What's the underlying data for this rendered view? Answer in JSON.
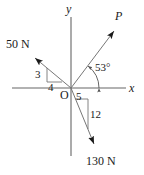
{
  "figure": {
    "background_color": "#ffffff",
    "stroke_color": "#555555",
    "text_color": "#1a1a1a"
  },
  "axes": {
    "origin_label": "O",
    "x_label": "x",
    "y_label": "y"
  },
  "vectors": [
    {
      "name": "force-50n",
      "label": "50 N",
      "magnitude": 50,
      "unit": "N",
      "direction": "upper-left",
      "slope_rise": "3",
      "slope_run": "4",
      "angle_from_neg_x_deg": 37
    },
    {
      "name": "force-p",
      "label": "P",
      "direction": "upper-right",
      "angle_label": "53°",
      "angle_from_pos_x_deg": 53
    },
    {
      "name": "force-130n",
      "label": "130 N",
      "magnitude": 130,
      "unit": "N",
      "direction": "lower-right",
      "slope_run": "5",
      "slope_rise": "12",
      "angle_from_neg_y_deg": 22.6
    }
  ],
  "annotations": {
    "triangle_50n_vertical": "3",
    "triangle_50n_horizontal": "4",
    "triangle_130n_horizontal": "5",
    "triangle_130n_vertical": "12",
    "angle_p": "53°"
  }
}
